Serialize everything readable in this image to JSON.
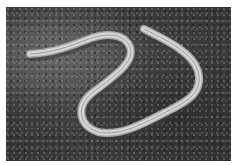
{
  "image": {
    "subject": "slow worm (legless lizard) lying on moss",
    "style": "grayscale photograph",
    "border_color": "#ffffff",
    "colors": {
      "moss_dark": "#2e2e2e",
      "moss_mid": "#4a4a4a",
      "moss_light": "#8a8a8a",
      "body_light": "#d8d8d8",
      "body_stripe": "#9a9a9a"
    }
  }
}
